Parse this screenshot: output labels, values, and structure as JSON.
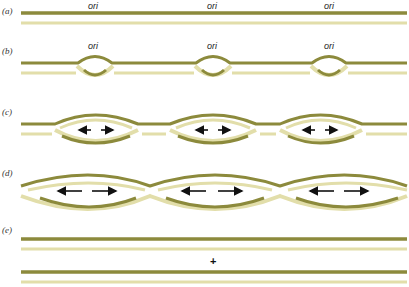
{
  "figure": {
    "panels": [
      {
        "label": "(a)",
        "ori_labels": [
          "ori",
          "ori",
          "ori"
        ]
      },
      {
        "label": "(b)",
        "ori_labels": [
          "ori",
          "ori",
          "ori"
        ]
      },
      {
        "label": "(c)"
      },
      {
        "label": "(d)"
      },
      {
        "label": "(e)",
        "symbol": "+"
      }
    ],
    "colors": {
      "parental_strand": "#8c8a3c",
      "new_strand": "#e2deaa",
      "arrow": "#111111"
    }
  }
}
